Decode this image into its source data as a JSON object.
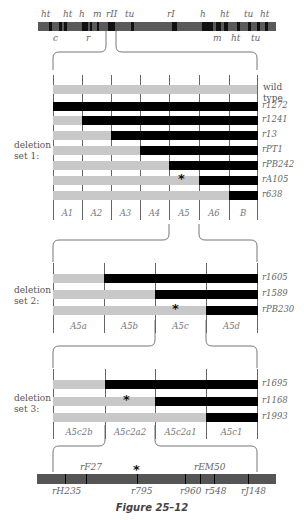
{
  "top_chromosome": {
    "labels_above": [
      {
        "text": "ht",
        "x": 47
      },
      {
        "text": "ht",
        "x": 69
      },
      {
        "text": "h",
        "x": 85
      },
      {
        "text": "m",
        "x": 99
      },
      {
        "text": "rII",
        "x": 112
      },
      {
        "text": "tu",
        "x": 131
      },
      {
        "text": "rI",
        "x": 173
      },
      {
        "text": "h",
        "x": 206
      },
      {
        "text": "ht",
        "x": 226
      },
      {
        "text": "tu",
        "x": 250
      },
      {
        "text": "ht",
        "x": 266
      }
    ],
    "labels_below": [
      {
        "text": "c",
        "x": 59
      },
      {
        "text": "r",
        "x": 92
      },
      {
        "text": "m",
        "x": 219
      },
      {
        "text": "ht",
        "x": 237
      },
      {
        "text": "tu",
        "x": 257
      }
    ]
  },
  "set1": {
    "label_line1": "deletion",
    "label_line2": "set 1:",
    "wild_type_line1": "wild",
    "wild_type_line2": "type",
    "rows": [
      {
        "name": "r1272",
        "start": 0
      },
      {
        "name": "r1241",
        "start": 1
      },
      {
        "name": "r13",
        "start": 2
      },
      {
        "name": "rPT1",
        "start": 3
      },
      {
        "name": "rPB242",
        "start": 4
      },
      {
        "name": "rA105",
        "start": 5
      },
      {
        "name": "r638",
        "start": 6
      }
    ],
    "segments": [
      "A1",
      "A2",
      "A3",
      "A4",
      "A5",
      "A6",
      "B"
    ]
  },
  "set2": {
    "label_line1": "deletion",
    "label_line2": "set 2:",
    "rows": [
      {
        "name": "r1605",
        "start": 1
      },
      {
        "name": "r1589",
        "start": 2
      },
      {
        "name": "rPB230",
        "start": 3
      }
    ],
    "segments": [
      "A5a",
      "A5b",
      "A5c",
      "A5d"
    ]
  },
  "set3": {
    "label_line1": "deletion",
    "label_line2": "set 3:",
    "rows": [
      {
        "name": "r1695",
        "start": 1
      },
      {
        "name": "r1168",
        "start": 2
      },
      {
        "name": "r1993",
        "start": 3
      }
    ],
    "segments": [
      "A5c2b",
      "A5c2a2",
      "A5c2a1",
      "A5c1"
    ]
  },
  "bottom_chromosome": {
    "labels_above": [
      {
        "text": "rF27",
        "x": 86
      },
      {
        "text": "rEM50",
        "x": 200
      }
    ],
    "labels_below": [
      {
        "text": "rH235",
        "x": 58
      },
      {
        "text": "r795",
        "x": 137
      },
      {
        "text": "r960",
        "x": 186
      },
      {
        "text": "r548",
        "x": 211
      },
      {
        "text": "rJ148",
        "x": 247
      }
    ],
    "star": "*"
  },
  "mutation_marker": "*",
  "caption": "Figure 25–12"
}
